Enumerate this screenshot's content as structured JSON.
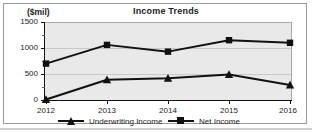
{
  "chart_data": {
    "type": "line",
    "title": "Income Trends",
    "xlabel": "",
    "ylabel": "($mil)",
    "categories": [
      "2012",
      "2013",
      "2014",
      "2015",
      "2016"
    ],
    "ylim": [
      0,
      1500
    ],
    "yticks": [
      0,
      500,
      1000,
      1500
    ],
    "ytick_labels": [
      "0",
      "500",
      "1000",
      "1500"
    ],
    "grid": true,
    "legend_position": "bottom",
    "series": [
      {
        "name": "Underwriting Income",
        "marker": "triangle",
        "color": "#111111",
        "values": [
          10,
          390,
          420,
          490,
          290
        ]
      },
      {
        "name": "Net Income",
        "marker": "square",
        "color": "#111111",
        "values": [
          700,
          1060,
          930,
          1150,
          1100
        ]
      }
    ]
  },
  "chart": {
    "title": "Income Trends",
    "unit_label": "($mil)",
    "plot_background": "#e9e9e9",
    "axis_color": "#111111",
    "gridline_color": "#c9c9c9"
  },
  "axis": {
    "y_labels": [
      "1500",
      "1000",
      "500",
      "0"
    ],
    "x_labels": [
      "2012",
      "2013",
      "2014",
      "2015",
      "2016"
    ]
  },
  "legend": {
    "items": [
      {
        "label": "Underwriting Income",
        "marker": "triangle"
      },
      {
        "label": "Net Income",
        "marker": "square"
      }
    ]
  }
}
